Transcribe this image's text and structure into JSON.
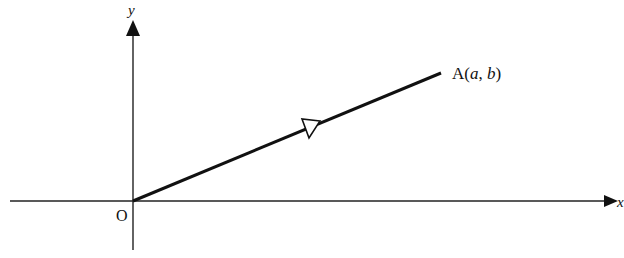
{
  "diagram": {
    "type": "coordinate-vector",
    "axes": {
      "x_label": "x",
      "y_label": "y",
      "origin_label": "O"
    },
    "vector": {
      "from": "O",
      "to_label_prefix": "A(",
      "to_a": "a",
      "to_sep": ", ",
      "to_b": "b",
      "to_suffix": ")",
      "direction_marker": "open-arrowhead"
    },
    "colors": {
      "stroke": "#111111",
      "background": "#ffffff"
    }
  }
}
